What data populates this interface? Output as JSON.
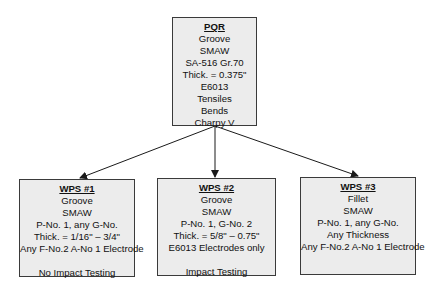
{
  "pqr": {
    "title": "PQR",
    "lines": [
      "Groove",
      "SMAW",
      "SA-516 Gr.70",
      "Thick. = 0.375\"",
      "E6013",
      "Tensiles",
      "Bends",
      "Charpy V"
    ]
  },
  "wps": [
    {
      "title": "WPS #1",
      "lines": [
        "Groove",
        "SMAW",
        "P-No. 1, any G-No.",
        "Thick. = 1/16\" – 3/4\"",
        "Any F-No.2 A-No 1 Electrode"
      ],
      "note": "No Impact Testing"
    },
    {
      "title": "WPS #2",
      "lines": [
        "Groove",
        "SMAW",
        "P-No. 1, G-No. 2",
        "Thick. = 5/8\" – 0.75\"",
        "E6013 Electrodes only"
      ],
      "note": "Impact Testing"
    },
    {
      "title": "WPS #3",
      "lines": [
        "Fillet",
        "SMAW",
        "P-No. 1, any G-No.",
        "Any Thickness",
        "Any F-No.2 A-No 1 Electrode"
      ],
      "note": ""
    }
  ],
  "colors": {
    "box_fill": "#ececec",
    "box_border": "#3a3a3a",
    "arrow": "#1a1a1a"
  }
}
